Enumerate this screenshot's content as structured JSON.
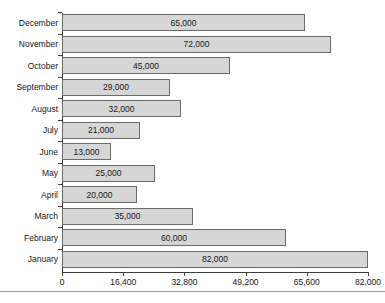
{
  "chart_data": {
    "type": "bar",
    "orientation": "horizontal",
    "title": "",
    "subtitle": "",
    "xlabel": "",
    "ylabel": "",
    "grid": false,
    "legend": false,
    "xlim": [
      0,
      82000
    ],
    "categories": [
      "December",
      "November",
      "October",
      "September",
      "August",
      "July",
      "June",
      "May",
      "April",
      "March",
      "February",
      "January"
    ],
    "values": [
      65000,
      72000,
      45000,
      29000,
      32000,
      21000,
      13000,
      25000,
      20000,
      35000,
      60000,
      82000
    ],
    "value_labels": [
      "65,000",
      "72,000",
      "45,000",
      "29,000",
      "32,000",
      "21,000",
      "13,000",
      "25,000",
      "20,000",
      "35,000",
      "60,000",
      "82,000"
    ],
    "xticks": [
      0,
      16400,
      32800,
      49200,
      65600,
      82000
    ],
    "xtick_labels": [
      "0",
      "16,400",
      "32,800",
      "49,200",
      "65,600",
      "82,000"
    ],
    "bar_fill_color": "#d6d6d6",
    "bar_border_color": "#6b6b6b",
    "axis_color": "#3d3d3d"
  }
}
